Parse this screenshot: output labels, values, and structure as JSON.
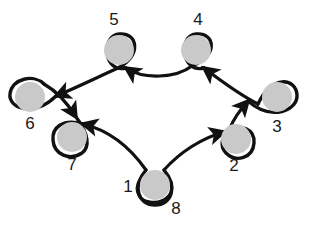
{
  "figure": {
    "title": "",
    "type": "directed-graph-diagram",
    "background_color": "#ffffff",
    "node_fill_color": "#c9c9c9",
    "node_stroke_color": "#111111",
    "edge_color": "#111111",
    "label_color": "#1a1a1a"
  },
  "nodes": [
    {
      "id": "8",
      "label": "8",
      "cx": 155,
      "cy": 185,
      "r": 15,
      "label_x": 176,
      "label_y": 210,
      "loop": "double-teardrop-up"
    },
    {
      "id": "1",
      "label": "1",
      "cx": 155,
      "cy": 185,
      "r": 15,
      "label_x": 128,
      "label_y": 188,
      "loop": "inner-circle"
    },
    {
      "id": "7",
      "label": "7",
      "cx": 72,
      "cy": 137,
      "r": 15,
      "label_x": 72,
      "label_y": 166,
      "loop": "open-upper-right"
    },
    {
      "id": "6",
      "label": "6",
      "cx": 30,
      "cy": 97,
      "r": 15,
      "label_x": 30,
      "label_y": 125,
      "loop": "horizontal-right"
    },
    {
      "id": "5",
      "label": "5",
      "cx": 119,
      "cy": 50,
      "r": 15,
      "label_x": 114,
      "label_y": 21,
      "loop": "vertical-down"
    },
    {
      "id": "4",
      "label": "4",
      "cx": 196,
      "cy": 50,
      "r": 15,
      "label_x": 198,
      "label_y": 21,
      "loop": "vertical-down"
    },
    {
      "id": "3",
      "label": "3",
      "cx": 277,
      "cy": 97,
      "r": 15,
      "label_x": 277,
      "label_y": 128,
      "loop": "horizontal-left"
    },
    {
      "id": "2",
      "label": "2",
      "cx": 236,
      "cy": 139,
      "r": 15,
      "label_x": 234,
      "label_y": 167,
      "loop": "open-upper-left"
    }
  ],
  "edges": [
    {
      "from": "8",
      "to": "7",
      "direction": "up-left",
      "arrow": true
    },
    {
      "from": "7",
      "to": "6",
      "direction": "up-left",
      "arrow": true
    },
    {
      "from": "6",
      "to": "5",
      "direction": "up-right",
      "arrow": true
    },
    {
      "from": "5",
      "to": "4",
      "direction": "right",
      "arrow": true
    },
    {
      "from": "4",
      "to": "3",
      "direction": "down-right",
      "arrow": true
    },
    {
      "from": "3",
      "to": "2",
      "direction": "down-left",
      "arrow": true
    },
    {
      "from": "2",
      "to": "8",
      "direction": "down-left",
      "arrow": true
    }
  ],
  "labels": {
    "n1": "1",
    "n2": "2",
    "n3": "3",
    "n4": "4",
    "n5": "5",
    "n6": "6",
    "n7": "7",
    "n8": "8"
  }
}
